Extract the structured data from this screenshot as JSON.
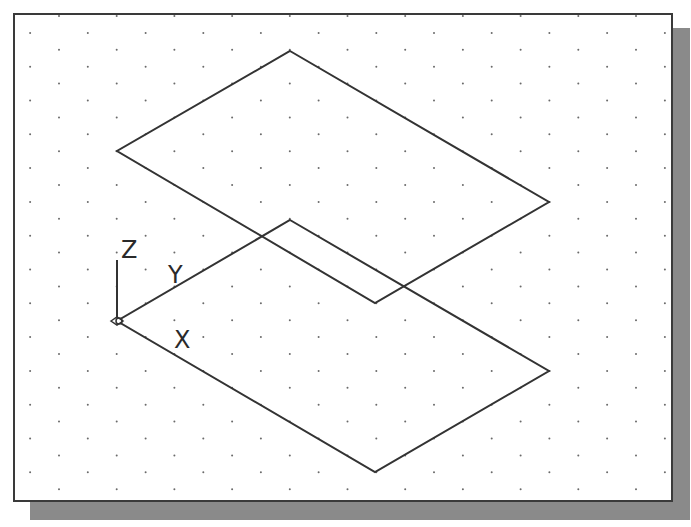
{
  "viewport": {
    "title": "AutoCAD isometric view with two parallel rectangles on dotted grid",
    "background": "#ffffff",
    "frame_color": "#3a3a3a",
    "shadow_color": "#8a8a8a",
    "line_color": "#333333",
    "grid": {
      "dot_color": "#6a6a6a",
      "origin_x": 59,
      "origin_y": 16,
      "dx": 57.7,
      "dy": 16.9,
      "rows": 29,
      "staggered": true
    }
  },
  "ucs_icon": {
    "origin": [
      117,
      321
    ],
    "labels": {
      "x": "X",
      "y": "Y",
      "z": "Z"
    }
  },
  "shapes": {
    "upper_rectangle": {
      "points": [
        [
          290,
          51
        ],
        [
          549,
          202
        ],
        [
          375,
          303
        ],
        [
          117,
          151
        ]
      ]
    },
    "lower_rectangle": {
      "points": [
        [
          290,
          220
        ],
        [
          549,
          371
        ],
        [
          375,
          472
        ],
        [
          117,
          321
        ]
      ]
    }
  }
}
